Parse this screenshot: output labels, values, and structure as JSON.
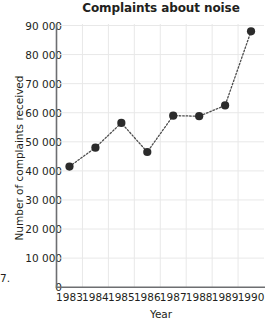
{
  "chart_data": {
    "type": "line",
    "title": "Complaints about noise",
    "xlabel": "Year",
    "ylabel": "Number of complaints received",
    "categories": [
      "1983",
      "1984",
      "1985",
      "1986",
      "1987",
      "1988",
      "1989",
      "1990"
    ],
    "x": [
      1983,
      1984,
      1985,
      1986,
      1987,
      1988,
      1989,
      1990
    ],
    "values": [
      41500,
      48000,
      56500,
      46500,
      59000,
      58800,
      62500,
      88000
    ],
    "series": [
      {
        "name": "Complaints about noise",
        "values": [
          41500,
          48000,
          56500,
          46500,
          59000,
          58800,
          62500,
          88000
        ]
      }
    ],
    "ylim": [
      0,
      90000
    ],
    "xlim": [
      1982.5,
      1990.5
    ],
    "yticks": [
      0,
      10000,
      20000,
      30000,
      40000,
      50000,
      60000,
      70000,
      80000,
      90000
    ],
    "ytick_labels": [
      "0",
      "10 000",
      "20 000",
      "30 000",
      "40 000",
      "50 000",
      "60 000",
      "70 000",
      "80 000",
      "90 000"
    ],
    "xtick_labels": [
      "1983",
      "1984",
      "1985",
      "1986",
      "1987",
      "1988",
      "1989",
      "1990"
    ],
    "grid": true,
    "grid_axis": "both",
    "legend": false,
    "legend_position": "none",
    "line_style": "dotted",
    "marker": "circle"
  },
  "colors": {
    "background": "#ffffff",
    "text": "#231f20",
    "grid": "#e8e8e8",
    "axis": "#6d6e71",
    "marker": "#2b2b2b",
    "line": "#4d4d4d"
  },
  "artifacts": {
    "left_edge_fragment": "7."
  }
}
